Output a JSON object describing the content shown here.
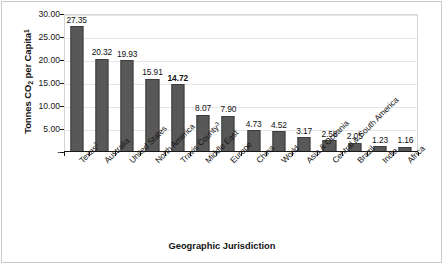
{
  "chart_data": {
    "type": "bar",
    "title": "",
    "xlabel": "Geographic Jurisdiction",
    "ylabel": "Tonnes CO2 per Capita1",
    "ylabel_parts": {
      "pre": "Tonnes CO",
      "sub": "2",
      "mid": " per Capita",
      "sup": "1"
    },
    "categories": [
      "Texas2",
      "Australia",
      "United States",
      "North America",
      "Travis County3",
      "Middle East",
      "Europe",
      "China",
      "World",
      "Asia & Oceania",
      "Central & South America",
      "Brazil",
      "India",
      "Africa"
    ],
    "category_parts": [
      {
        "text": "Texas",
        "sup": "2"
      },
      {
        "text": "Australia",
        "sup": ""
      },
      {
        "text": "United States",
        "sup": ""
      },
      {
        "text": "North America",
        "sup": ""
      },
      {
        "text": "Travis County",
        "sup": "3"
      },
      {
        "text": "Middle East",
        "sup": ""
      },
      {
        "text": "Europe",
        "sup": ""
      },
      {
        "text": "China",
        "sup": ""
      },
      {
        "text": "World",
        "sup": ""
      },
      {
        "text": "Asia & Oceania",
        "sup": ""
      },
      {
        "text": "Central & South America",
        "sup": ""
      },
      {
        "text": "Brazil",
        "sup": ""
      },
      {
        "text": "India",
        "sup": ""
      },
      {
        "text": "Africa",
        "sup": ""
      }
    ],
    "values": [
      27.35,
      20.32,
      19.93,
      15.91,
      14.72,
      8.07,
      7.9,
      4.73,
      4.52,
      3.17,
      2.58,
      2.05,
      1.23,
      1.16
    ],
    "value_labels": [
      "27.35",
      "20.32",
      "19.93",
      "15.91",
      "14.72",
      "8.07",
      "7.90",
      "4.73",
      "4.52",
      "3.17",
      "2.58",
      "2.05",
      "1.23",
      "1.16"
    ],
    "emphasized_index": 4,
    "ylim": [
      0,
      30
    ],
    "ytick_values": [
      0,
      5,
      10,
      15,
      20,
      25,
      30
    ],
    "ytick_labels": [
      "-",
      "5.00",
      "10.00",
      "15.00",
      "20.00",
      "25.00",
      "30.00"
    ],
    "grid": true,
    "legend": "none",
    "bar_color": "#585858",
    "bar_border_color": "#3d3d3d",
    "axis_color": "#1a1a1a",
    "gridline_color": "#e6e6e6"
  }
}
